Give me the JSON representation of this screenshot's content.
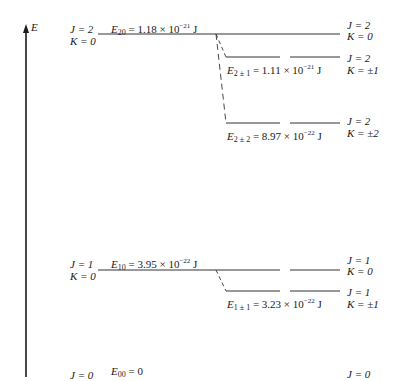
{
  "axis": {
    "label": "E"
  },
  "levels": [
    {
      "id": "E20",
      "left_label": {
        "J": "J = 2",
        "K": "K = 0"
      },
      "energy_label": {
        "sym": "E",
        "sub": "20",
        "eq": " = 1.18 × 10",
        "exp": "−21",
        "unit": " J"
      },
      "right_label": {
        "J": "J = 2",
        "K": "K = 0"
      }
    },
    {
      "id": "E2pm1",
      "energy_label": {
        "sym": "E",
        "sub": "2 ± 1",
        "eq": " = 1.11 × 10",
        "exp": "−21",
        "unit": " J"
      },
      "right_label": {
        "J": "J = 2",
        "K": "K = ±1"
      }
    },
    {
      "id": "E2pm2",
      "energy_label": {
        "sym": "E",
        "sub": "2 ± 2",
        "eq": " = 8.97 × 10",
        "exp": "−22",
        "unit": " J"
      },
      "right_label": {
        "J": "J = 2",
        "K": "K = ±2"
      }
    },
    {
      "id": "E10",
      "left_label": {
        "J": "J = 1",
        "K": "K = 0"
      },
      "energy_label": {
        "sym": "E",
        "sub": "10",
        "eq": " = 3.95 × 10",
        "exp": "−22",
        "unit": " J"
      },
      "right_label": {
        "J": "J = 1",
        "K": "K = 0"
      }
    },
    {
      "id": "E1pm1",
      "energy_label": {
        "sym": "E",
        "sub": "1 ± 1",
        "eq": " = 3.23 × 10",
        "exp": "−22",
        "unit": " J"
      },
      "right_label": {
        "J": "J = 1",
        "K": "K = ±1"
      }
    },
    {
      "id": "E00",
      "left_label": {
        "J": "J = 0"
      },
      "energy_label": {
        "sym": "E",
        "sub": "00",
        "eq": " = 0"
      },
      "right_label": {
        "J": "J = 0"
      }
    }
  ]
}
